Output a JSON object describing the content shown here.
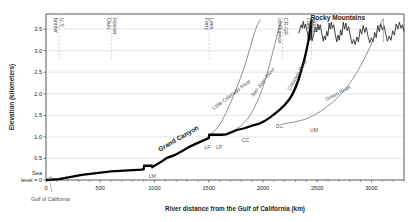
{
  "chart_data": {
    "type": "line",
    "title": "",
    "xlabel": "River distance from the Gulf of California  (km)",
    "ylabel": "Elevation (kilometers)",
    "xlim": [
      0,
      3300
    ],
    "ylim": [
      0,
      3.85
    ],
    "grid": true,
    "legend_position": "none",
    "xticks": [
      0,
      500,
      1000,
      1500,
      2000,
      2500,
      3000
    ],
    "xticklabels": [
      "0",
      "500",
      "1000",
      "1500",
      "2000",
      "2500",
      "3000"
    ],
    "yticks": [
      0,
      0.5,
      1.0,
      1.5,
      2.0,
      2.5,
      3.0,
      3.5
    ],
    "yticklabels": [
      "Sea\nlevel = 0",
      "0.5",
      "1.0",
      "1.5",
      "2.0",
      "2.5",
      "3.0",
      "3.5"
    ],
    "y_zero_label_line1": "Sea",
    "y_zero_label_line2": "level = 0",
    "series": [
      {
        "name": "Colorado River main stem",
        "style": "thick-black-stepped",
        "points": [
          [
            0,
            0.0
          ],
          [
            120,
            0.02
          ],
          [
            330,
            0.12
          ],
          [
            600,
            0.2
          ],
          [
            880,
            0.24
          ],
          [
            900,
            0.25
          ],
          [
            905,
            0.33
          ],
          [
            975,
            0.33
          ],
          [
            980,
            0.3
          ],
          [
            1060,
            0.42
          ],
          [
            1120,
            0.52
          ],
          [
            1180,
            0.57
          ],
          [
            1260,
            0.68
          ],
          [
            1330,
            0.78
          ],
          [
            1400,
            0.86
          ],
          [
            1470,
            0.94
          ],
          [
            1500,
            0.97
          ],
          [
            1505,
            1.05
          ],
          [
            1620,
            1.05
          ],
          [
            1660,
            1.06
          ],
          [
            1700,
            1.1
          ],
          [
            1760,
            1.16
          ],
          [
            1830,
            1.2
          ],
          [
            1900,
            1.26
          ],
          [
            1960,
            1.3
          ],
          [
            2010,
            1.36
          ],
          [
            2060,
            1.44
          ],
          [
            2110,
            1.54
          ],
          [
            2150,
            1.62
          ],
          [
            2200,
            1.74
          ],
          [
            2240,
            1.86
          ],
          [
            2270,
            1.98
          ],
          [
            2300,
            2.14
          ],
          [
            2330,
            2.34
          ],
          [
            2355,
            2.56
          ],
          [
            2380,
            2.78
          ],
          [
            2400,
            3.0
          ],
          [
            2418,
            3.22
          ],
          [
            2430,
            3.42
          ],
          [
            2440,
            3.6
          ],
          [
            2448,
            3.72
          ]
        ]
      },
      {
        "name": "Little Colorado River",
        "style": "thin-gray",
        "points": [
          [
            1510,
            1.04
          ],
          [
            1570,
            1.18
          ],
          [
            1620,
            1.36
          ],
          [
            1660,
            1.56
          ],
          [
            1700,
            1.78
          ],
          [
            1740,
            2.02
          ],
          [
            1780,
            2.28
          ],
          [
            1820,
            2.56
          ],
          [
            1855,
            2.84
          ],
          [
            1885,
            3.1
          ],
          [
            1915,
            3.36
          ],
          [
            1945,
            3.58
          ],
          [
            1975,
            3.72
          ]
        ]
      },
      {
        "name": "San Juan River",
        "style": "thin-gray",
        "points": [
          [
            1700,
            1.1
          ],
          [
            1790,
            1.24
          ],
          [
            1860,
            1.42
          ],
          [
            1910,
            1.62
          ],
          [
            1955,
            1.86
          ],
          [
            1995,
            2.12
          ],
          [
            2030,
            2.4
          ],
          [
            2062,
            2.68
          ],
          [
            2090,
            2.96
          ],
          [
            2118,
            3.24
          ],
          [
            2145,
            3.5
          ],
          [
            2170,
            3.68
          ]
        ]
      },
      {
        "name": "Colorado River upper",
        "style": "thin-gray",
        "points": [
          [
            2150,
            1.62
          ],
          [
            2210,
            1.78
          ],
          [
            2262,
            1.98
          ],
          [
            2305,
            2.22
          ],
          [
            2342,
            2.48
          ],
          [
            2375,
            2.76
          ],
          [
            2404,
            3.04
          ],
          [
            2430,
            3.32
          ],
          [
            2452,
            3.56
          ],
          [
            2470,
            3.72
          ]
        ]
      },
      {
        "name": "Green River",
        "style": "thin-gray",
        "points": [
          [
            2180,
            1.3
          ],
          [
            2280,
            1.34
          ],
          [
            2380,
            1.4
          ],
          [
            2470,
            1.5
          ],
          [
            2560,
            1.64
          ],
          [
            2650,
            1.82
          ],
          [
            2730,
            2.02
          ],
          [
            2805,
            2.26
          ],
          [
            2872,
            2.52
          ],
          [
            2932,
            2.8
          ],
          [
            2986,
            3.08
          ],
          [
            3035,
            3.36
          ],
          [
            3078,
            3.6
          ],
          [
            3110,
            3.74
          ]
        ]
      }
    ],
    "top_annotations": [
      {
        "label": "U.S.\nborder",
        "line1": "U.S.",
        "line2": "border",
        "x": 120
      },
      {
        "label": "Hoover\nDam",
        "line1": "Hoover",
        "line2": "Dam",
        "x": 605
      },
      {
        "label": "Lees\nFerry",
        "line1": "Lees",
        "line2": "Ferry",
        "x": 1505
      },
      {
        "label": "CR-GR\nconfluence",
        "line1": "CR-GR",
        "line2": "confluence",
        "x": 2180
      },
      {
        "label": "Grand\nLake",
        "line1": "Grand",
        "line2": "Lake",
        "x": 2448
      }
    ],
    "region_labels": [
      {
        "label": "Grand Canyon",
        "x": 1230,
        "y": 0.92,
        "rotation": -30
      },
      {
        "label": "Rocky Mountains",
        "x": 2690,
        "y": 3.72,
        "rotation": 0
      }
    ],
    "river_labels": [
      {
        "label": "Little Colorado River",
        "x": 1720,
        "y": 1.95,
        "rotation": -37
      },
      {
        "label": "San Juan River",
        "x": 2010,
        "y": 2.25,
        "rotation": -52
      },
      {
        "label": "Colorado River",
        "x": 2330,
        "y": 2.42,
        "rotation": -60
      },
      {
        "label": "Green River",
        "x": 2700,
        "y": 1.98,
        "rotation": -28
      }
    ],
    "site_markers": [
      {
        "label": "LM",
        "x": 980,
        "y": 0.2
      },
      {
        "label": "LF",
        "x": 1488,
        "y": 0.86
      },
      {
        "label": "LP",
        "x": 1596,
        "y": 0.87
      },
      {
        "label": "CC",
        "x": 1840,
        "y": 1.03
      },
      {
        "label": "DC",
        "x": 2152,
        "y": 1.35
      },
      {
        "label": "UM",
        "x": 2470,
        "y": 1.26
      }
    ],
    "callout": {
      "label": "Gulf of California",
      "target_x": 0,
      "target_y": 0
    }
  }
}
